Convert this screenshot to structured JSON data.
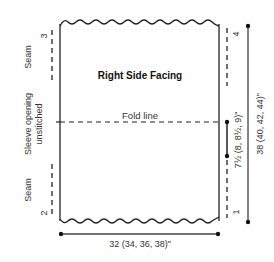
{
  "diagram": {
    "title": "Right Side Facing",
    "fold_line_label": "Fold line",
    "left_labels": {
      "seam_top": "Seam",
      "seam_bottom": "Seam",
      "sleeve_opening_line1": "Sleeve opening",
      "sleeve_opening_line2": "unstitched"
    },
    "markers": {
      "top_left": "3",
      "bottom_left": "2",
      "top_right": "4",
      "bottom_right": "1"
    },
    "measurements": {
      "width": "32 (34, 36, 38)\"",
      "height": "38 (40, 42, 44)\"",
      "opening": "7½ (8, 8½, 9)\""
    },
    "colors": {
      "line": "#222222",
      "text": "#333333"
    }
  }
}
